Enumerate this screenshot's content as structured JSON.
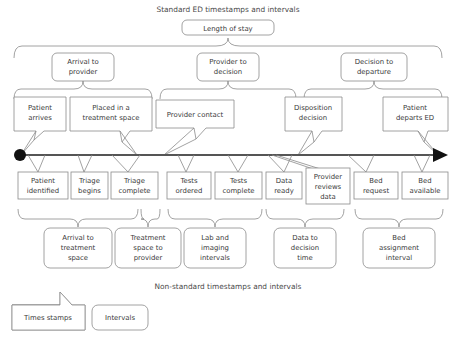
{
  "titles": {
    "top": "Standard ED timestamps and intervals",
    "bottom": "Non-standard timestamps and intervals"
  },
  "overall": {
    "label": "Length of stay"
  },
  "major_intervals": [
    {
      "label": "Arrival to provider"
    },
    {
      "label": "Provider to decision"
    },
    {
      "label": "Decision to departure"
    }
  ],
  "standard_timestamps": [
    {
      "label": "Patient arrives"
    },
    {
      "label": "Placed in a treatment space"
    },
    {
      "label": "Provider contact"
    },
    {
      "label": "Disposition decision"
    },
    {
      "label": "Patient departs ED"
    }
  ],
  "nonstandard_timestamps": [
    {
      "label": "Patient identified"
    },
    {
      "label": "Triage begins"
    },
    {
      "label": "Triage complete"
    },
    {
      "label": "Tests ordered"
    },
    {
      "label": "Tests complete"
    },
    {
      "label": "Data ready"
    },
    {
      "label": "Provider reviews data"
    },
    {
      "label": "Bed request"
    },
    {
      "label": "Bed available"
    }
  ],
  "nonstandard_intervals": [
    {
      "label": "Arrival to treatment space"
    },
    {
      "label": "Treatment space to provider"
    },
    {
      "label": "Lab and imaging intervals"
    },
    {
      "label": "Data to decision time"
    },
    {
      "label": "Bed assignment interval"
    }
  ],
  "legend": [
    {
      "label": "Times stamps",
      "shape": "callout"
    },
    {
      "label": "Intervals",
      "shape": "rounded-rect"
    }
  ],
  "colors": {
    "stroke": "#8a8a8a",
    "axis": "#555555",
    "text": "#3a3a3a",
    "background": "#ffffff"
  }
}
